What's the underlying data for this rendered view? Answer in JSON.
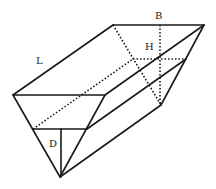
{
  "diagram": {
    "title": "",
    "type": "triangular trough prism with water level",
    "labels": {
      "length": "L",
      "width": "B",
      "height": "H",
      "depth": "D"
    },
    "colors": {
      "stroke": "#1a1a1a",
      "background": "#ffffff"
    }
  }
}
